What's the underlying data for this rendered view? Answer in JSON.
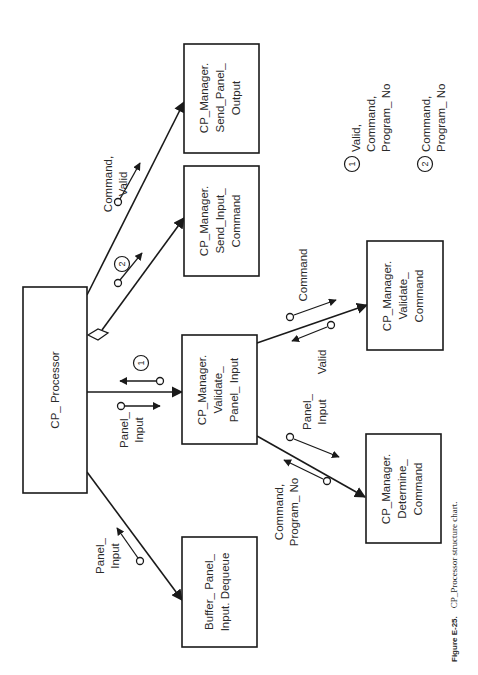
{
  "modules": {
    "root": {
      "lines": [
        "CP_ Processor"
      ]
    },
    "buffer_dequeue": {
      "lines": [
        "Buffer_ Panel_",
        "Input. Dequeue"
      ]
    },
    "validate_panel_input": {
      "lines": [
        "CP_Manager.",
        "Validate_",
        "Panel_ Input"
      ]
    },
    "send_input_command": {
      "lines": [
        "CP_Manager.",
        "Send_Input_",
        "Command"
      ]
    },
    "send_panel_output": {
      "lines": [
        "CP_Manager.",
        "Send_Panel_",
        "Output"
      ]
    },
    "validate_command": {
      "lines": [
        "CP_Manager.",
        "Validate_",
        "Command"
      ]
    },
    "determine_command": {
      "lines": [
        "CP_Manager.",
        "Determine_",
        "Command"
      ]
    }
  },
  "couples": {
    "buffer_panel_input": {
      "lines": [
        "Panel_",
        "Input"
      ]
    },
    "vpi_panel_input": {
      "lines": [
        "Panel_",
        "Input"
      ]
    },
    "vpi_return_ref": "1",
    "sic_ref": "2",
    "spo_command_valid": {
      "lines": [
        "Command,",
        "Valid"
      ]
    },
    "vc_command": {
      "lines": [
        "Command"
      ]
    },
    "vc_valid": {
      "lines": [
        "Valid"
      ]
    },
    "dc_panel_input": {
      "lines": [
        "Panel_",
        "Input"
      ]
    },
    "dc_command_program": {
      "lines": [
        "Command,",
        "Program_ No"
      ]
    }
  },
  "legend": [
    {
      "ref": "1",
      "lines": [
        "Valid,",
        "Command,",
        "Program_ No"
      ]
    },
    {
      "ref": "2",
      "lines": [
        "Command,",
        "Program_ No"
      ]
    }
  ],
  "caption": {
    "label": "Figure E-25.",
    "text": "CP_Processor structure chart."
  }
}
